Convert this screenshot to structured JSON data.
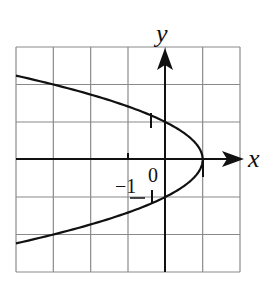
{
  "chart_data": {
    "type": "line",
    "title": "",
    "xlabel": "x",
    "ylabel": "y",
    "equation": "x = 1 - y^2",
    "xlim": [
      -4,
      2
    ],
    "ylim": [
      -3,
      3
    ],
    "grid": true,
    "grid_step": 1,
    "tick_labels": {
      "x_neg": "−1",
      "x_pos": "1",
      "y_pos": "1",
      "origin": "0"
    },
    "series": [
      {
        "name": "parabola",
        "points": [
          {
            "x": -4,
            "y": 2.236
          },
          {
            "x": -3,
            "y": 2
          },
          {
            "x": -2,
            "y": 1.732
          },
          {
            "x": -1,
            "y": 1.414
          },
          {
            "x": 0,
            "y": 1
          },
          {
            "x": 0.75,
            "y": 0.5
          },
          {
            "x": 1,
            "y": 0
          },
          {
            "x": 0.75,
            "y": -0.5
          },
          {
            "x": 0,
            "y": -1
          },
          {
            "x": -1,
            "y": -1.414
          },
          {
            "x": -2,
            "y": -1.732
          },
          {
            "x": -3,
            "y": -2
          },
          {
            "x": -4,
            "y": -2.236
          }
        ]
      }
    ],
    "colors": {
      "grid": "#8a8a8a",
      "axis": "#111111",
      "curve": "#111111"
    }
  }
}
